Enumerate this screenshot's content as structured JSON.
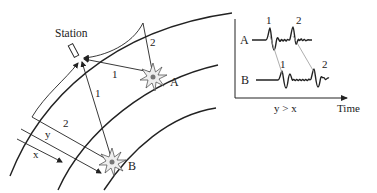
{
  "diagram": {
    "station_label": "Station",
    "source_a_label": "A",
    "source_b_label": "B",
    "ray_labels": {
      "a_direct": "1",
      "a_reflected": "2",
      "b_direct": "1",
      "b_reflected": "2"
    },
    "distance_labels": {
      "x": "x",
      "y": "y"
    }
  },
  "seismogram": {
    "trace_a_label": "A",
    "trace_b_label": "B",
    "trace_a_phase_1": "1",
    "trace_a_phase_2": "2",
    "trace_b_phase_1": "1",
    "trace_b_phase_2": "2",
    "x_axis_label": "Time",
    "condition": "y > x"
  },
  "colors": {
    "line": "#222222",
    "thin_line": "#555555",
    "correlation_line": "#999999",
    "star_fill": "#e8e8e8",
    "star_core": "#777777"
  }
}
